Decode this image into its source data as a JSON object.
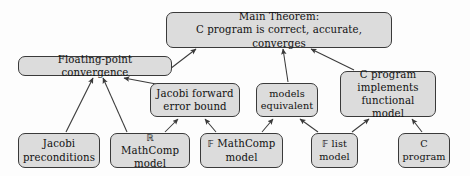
{
  "figure": {
    "colors": {
      "node_fill": "#dcdcdc",
      "node_border": "#3a3a3a",
      "edge": "#3a3a3a",
      "background": "#fdfdfd",
      "text": "#111111"
    }
  },
  "nodes": [
    {
      "id": "main-theorem",
      "label": "Main Theorem:\nC program is correct, accurate, converges",
      "x": 166,
      "y": 12,
      "w": 226,
      "h": 36
    },
    {
      "id": "floating-point-convergence",
      "label": "Floating-point convergence",
      "x": 18,
      "y": 56,
      "w": 154,
      "h": 20
    },
    {
      "id": "jacobi-forward-error-bound",
      "label": "Jacobi forward\nerror bound",
      "x": 150,
      "y": 83,
      "w": 90,
      "h": 34
    },
    {
      "id": "models-equivalent",
      "label": "models\nequivalent",
      "x": 256,
      "y": 83,
      "w": 62,
      "h": 34
    },
    {
      "id": "c-program-implements-functional-model",
      "label": "C program\nimplements\nfunctional model",
      "x": 340,
      "y": 71,
      "w": 96,
      "h": 46
    },
    {
      "id": "jacobi-preconditions",
      "label": "Jacobi\npreconditions",
      "x": 18,
      "y": 133,
      "w": 82,
      "h": 35
    },
    {
      "id": "r-mathcomp-model",
      "label": "ℝ MathComp\nmodel",
      "x": 110,
      "y": 133,
      "w": 80,
      "h": 35
    },
    {
      "id": "f-mathcomp-model",
      "label": "𝔽 MathComp\nmodel",
      "x": 200,
      "y": 133,
      "w": 83,
      "h": 35
    },
    {
      "id": "f-list-model",
      "label": "𝔽 list\nmodel",
      "x": 311,
      "y": 133,
      "w": 47,
      "h": 35
    },
    {
      "id": "c-program",
      "label": "C\nprogram",
      "x": 398,
      "y": 133,
      "w": 52,
      "h": 35
    }
  ],
  "edges": [
    {
      "id": "edge-fpc-to-main",
      "from": "floating-point-convergence",
      "to": "main-theorem",
      "path": "M 166 72 L 196 49"
    },
    {
      "id": "edge-models-to-main",
      "from": "models-equivalent",
      "to": "main-theorem",
      "path": "M 288 82 L 283 49"
    },
    {
      "id": "edge-cimpl-to-main",
      "from": "c-program-implements-functional-model",
      "to": "main-theorem",
      "path": "M 354 70 L 311 49"
    },
    {
      "id": "edge-jacobipre-to-fpc",
      "from": "jacobi-preconditions",
      "to": "floating-point-convergence",
      "path": "M 66 132 L 93 78"
    },
    {
      "id": "edge-rmathcomp-to-fpc",
      "from": "r-mathcomp-model",
      "to": "floating-point-convergence",
      "path": "M 127 132 L 103 78"
    },
    {
      "id": "edge-jfeb-to-fpc",
      "from": "jacobi-forward-error-bound",
      "to": "floating-point-convergence",
      "path": "M 156 84 L 124 78"
    },
    {
      "id": "edge-rmathcomp-to-jfeb",
      "from": "r-mathcomp-model",
      "to": "jacobi-forward-error-bound",
      "path": "M 165 132 L 178 119"
    },
    {
      "id": "edge-fmathcomp-to-jfeb",
      "from": "f-mathcomp-model",
      "to": "jacobi-forward-error-bound",
      "path": "M 216 132 L 205 119"
    },
    {
      "id": "edge-fmathcomp-to-models",
      "from": "f-mathcomp-model",
      "to": "models-equivalent",
      "path": "M 262 132 L 273 119"
    },
    {
      "id": "edge-flist-to-models",
      "from": "f-list-model",
      "to": "models-equivalent",
      "path": "M 318 132 L 300 119"
    },
    {
      "id": "edge-flist-to-cimpl",
      "from": "f-list-model",
      "to": "c-program-implements-functional-model",
      "path": "M 352 132 L 369 119"
    },
    {
      "id": "edge-cprogram-to-cimpl",
      "from": "c-program",
      "to": "c-program-implements-functional-model",
      "path": "M 422 132 L 412 119"
    }
  ]
}
